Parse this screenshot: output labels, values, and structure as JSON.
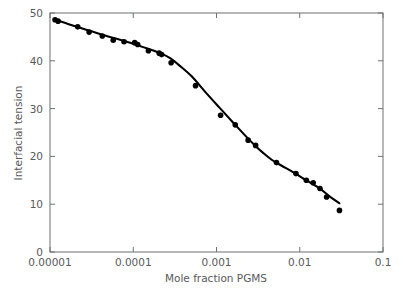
{
  "chart_data": {
    "type": "scatter",
    "title": "",
    "xlabel": "Mole fraction PGMS",
    "ylabel": "Interfacial tension",
    "xscale": "log",
    "yscale": "linear",
    "xlim": [
      1e-05,
      0.1
    ],
    "ylim": [
      0,
      50
    ],
    "grid": false,
    "legend": null,
    "xticks": [
      "0.00001",
      "0.0001",
      "0.001",
      "0.01",
      "0.1"
    ],
    "xtick_values": [
      1e-05,
      0.0001,
      0.001,
      0.01,
      0.1
    ],
    "yticks": [
      "0",
      "10",
      "20",
      "30",
      "40",
      "50"
    ],
    "ytick_values": [
      0,
      10,
      20,
      30,
      40,
      50
    ],
    "series": [
      {
        "name": "Interfacial tension data",
        "marker": "filled-circle",
        "color": "#000000",
        "x": [
          1.15e-05,
          1.25e-05,
          2.15e-05,
          2.95e-05,
          4.25e-05,
          5.75e-05,
          7.75e-05,
          0.000104,
          0.000113,
          0.000152,
          0.000205,
          0.000219,
          0.000285,
          0.00056,
          0.00112,
          0.00168,
          0.0024,
          0.00295,
          0.00525,
          0.009,
          0.012,
          0.0145,
          0.0175,
          0.021,
          0.03
        ],
        "y": [
          48.6,
          48.3,
          47.1,
          46.0,
          45.2,
          44.3,
          44.0,
          43.8,
          43.4,
          42.1,
          41.6,
          41.3,
          39.6,
          34.8,
          28.6,
          26.6,
          23.4,
          22.3,
          18.7,
          16.4,
          15.0,
          14.5,
          13.3,
          11.5,
          8.7
        ]
      }
    ],
    "fit_curve": {
      "name": "fitted trend line",
      "color": "#000000",
      "x": [
        1.13e-05,
        1.8e-05,
        3e-05,
        5e-05,
        8e-05,
        0.00012,
        0.00017,
        0.000225,
        0.00028,
        0.00036,
        0.0005,
        0.00075,
        0.0011,
        0.0016,
        0.0022,
        0.0029,
        0.0036,
        0.0046,
        0.006,
        0.0085,
        0.012,
        0.017,
        0.023,
        0.03
      ],
      "y": [
        48.7,
        47.5,
        46.3,
        45.1,
        44.1,
        43.1,
        42.2,
        41.4,
        40.5,
        39.0,
        36.8,
        33.3,
        30.1,
        27.0,
        24.4,
        22.3,
        20.8,
        19.3,
        18.1,
        16.6,
        15.0,
        13.4,
        11.6,
        10.2
      ]
    }
  },
  "axes": {
    "y_axis_label": "Interfacial tension",
    "x_axis_label": "Mole fraction PGMS",
    "y_tick_labels": [
      "50",
      "40",
      "30",
      "20",
      "10",
      "0"
    ],
    "x_tick_labels": [
      "0.00001",
      "0.0001",
      "0.001",
      "0.01",
      "0.1"
    ]
  },
  "colors": {
    "marker": "#000000",
    "curve": "#000000",
    "axis": "#6f7072",
    "text": "#58595b",
    "background": "#ffffff"
  }
}
